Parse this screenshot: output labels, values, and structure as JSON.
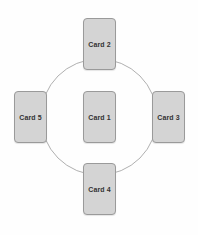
{
  "diagram": {
    "type": "radial-card-layout",
    "background_color": "#fefefe",
    "circle": {
      "name": "guide-circle",
      "center_x": 99,
      "center_y": 117,
      "radius": 58,
      "stroke_color": "#b0b0b0",
      "stroke_width": 1,
      "fill": "none"
    },
    "card_style": {
      "fill_color": "#d4d4d4",
      "border_color": "#9a9a9a",
      "text_color": "#333333",
      "width": 33,
      "height": 52,
      "corner_radius": 4
    },
    "cards": [
      {
        "id": "card-1",
        "label": "Card 1",
        "position": "center",
        "x": 83,
        "y": 91
      },
      {
        "id": "card-2",
        "label": "Card 2",
        "position": "top",
        "x": 83,
        "y": 18
      },
      {
        "id": "card-3",
        "label": "Card 3",
        "position": "right",
        "x": 152,
        "y": 91
      },
      {
        "id": "card-4",
        "label": "Card 4",
        "position": "bottom",
        "x": 83,
        "y": 163
      },
      {
        "id": "card-5",
        "label": "Card 5",
        "position": "left",
        "x": 14,
        "y": 91
      }
    ]
  }
}
